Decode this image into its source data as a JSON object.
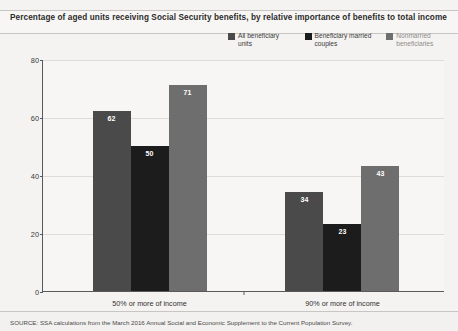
{
  "title": "Percentage of aged units receiving Social Security benefits, by relative importance of benefits to total income",
  "source": "SOURCE: SSA calculations from the March 2016 Annual Social and Economic Supplement to the Current Population Survey.",
  "axis": {
    "percent_label": "Percent",
    "yticks": [
      "0",
      "20",
      "40",
      "60",
      "80"
    ]
  },
  "legend": [
    {
      "label": "All beneficiary units",
      "color": "#4a4a4a"
    },
    {
      "label": "Beneficiary married couples",
      "color": "#1c1c1c"
    },
    {
      "label": "Nonmarried beneficiaries",
      "color": "#6e6e6e"
    }
  ],
  "chart_data": {
    "type": "bar",
    "title": "Percentage of aged units receiving Social Security benefits, by relative importance of benefits to total income",
    "xlabel": "",
    "ylabel": "Percent",
    "ylim": [
      0,
      80
    ],
    "yticks": [
      0,
      20,
      40,
      60,
      80
    ],
    "grid": true,
    "legend_position": "top-right",
    "categories": [
      "50% or more of income",
      "90% or more of income"
    ],
    "series": [
      {
        "name": "All beneficiary units",
        "color": "#4a4a4a",
        "values": [
          62,
          34
        ]
      },
      {
        "name": "Beneficiary married couples",
        "color": "#1c1c1c",
        "values": [
          50,
          23
        ]
      },
      {
        "name": "Nonmarried beneficiaries",
        "color": "#6e6e6e",
        "values": [
          71,
          43
        ]
      }
    ]
  }
}
